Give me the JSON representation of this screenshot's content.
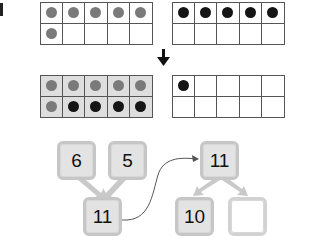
{
  "top_row": {
    "left_frame": {
      "filled": false,
      "cells": [
        "gray",
        "gray",
        "gray",
        "gray",
        "gray",
        "gray",
        "",
        "",
        "",
        ""
      ]
    },
    "right_frame": {
      "filled": false,
      "cells": [
        "black",
        "black",
        "black",
        "black",
        "black",
        "",
        "",
        "",
        "",
        ""
      ]
    }
  },
  "arrow": {
    "direction": "down",
    "icon": "down-arrow-icon"
  },
  "bottom_row": {
    "left_frame": {
      "filled": true,
      "cells": [
        "gray",
        "gray",
        "gray",
        "gray",
        "gray",
        "gray",
        "black",
        "black",
        "black",
        "black"
      ]
    },
    "right_frame": {
      "filled": false,
      "cells": [
        "black",
        "",
        "",
        "",
        "",
        "",
        "",
        "",
        "",
        ""
      ]
    }
  },
  "number_bond": {
    "left": {
      "part_a": "6",
      "part_b": "5",
      "whole": "11"
    },
    "right": {
      "whole": "11",
      "part_a": "10",
      "part_b": ""
    }
  },
  "colors": {
    "gray_dot": "#7a7a7a",
    "black_dot": "#151515",
    "box_fill": "#e3e3e3",
    "box_border": "#c6c6c6"
  }
}
